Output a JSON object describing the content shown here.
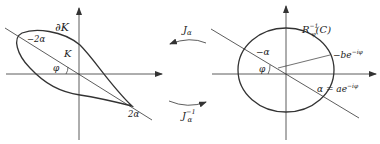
{
  "left_diagram": {
    "boundary_label": "∂K",
    "region_label": "K",
    "angle_label": "φ",
    "neg_point_label": "−2α",
    "pos_point_label": "2α"
  },
  "arrows": {
    "forward_label": "J",
    "forward_sub": "α",
    "inverse_label": "J",
    "inverse_sub": "α",
    "inverse_sup": "−1"
  },
  "right_diagram": {
    "circle_label_main": "R",
    "circle_label_sub": "φ",
    "circle_label_sup": "−1",
    "circle_label_arg": "(C)",
    "neg_point_label": "−α",
    "center_label": "−be",
    "center_label_sup": "−iφ",
    "angle_label": "φ",
    "pos_point_label": "α = ae",
    "pos_point_label_sup": "−iφ"
  },
  "colors": {
    "stroke": "#333333",
    "text": "#222222"
  }
}
